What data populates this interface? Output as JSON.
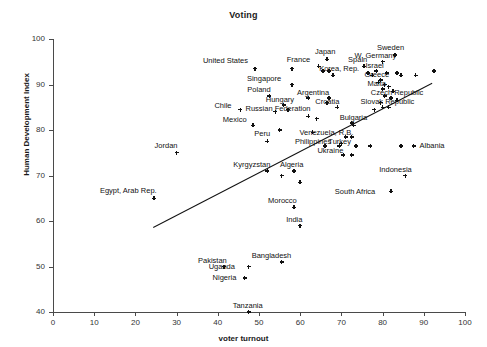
{
  "chart_data": {
    "type": "scatter",
    "title": "Voting",
    "xlabel": "voter turnout",
    "ylabel": "Human Development Index",
    "xlim": [
      0,
      100
    ],
    "ylim": [
      40,
      100
    ],
    "xticks": [
      0,
      10,
      20,
      30,
      40,
      50,
      60,
      70,
      80,
      90,
      100
    ],
    "yticks": [
      40,
      50,
      60,
      70,
      80,
      90,
      100
    ],
    "grid": false,
    "legend": "none",
    "marker_color": "#111111",
    "trendline": {
      "x0": 24.3,
      "y0": 58.7,
      "x1": 92.0,
      "y1": 90.4,
      "color": "#111111"
    },
    "points": [
      {
        "label": "United States",
        "x": 49.0,
        "y": 93.5,
        "lx": -52,
        "ly": -12
      },
      {
        "label": "Singapore",
        "x": 58.0,
        "y": 90.0,
        "lx": -45,
        "ly": -10
      },
      {
        "label": "France",
        "x": 64.5,
        "y": 94.0,
        "lx": -32,
        "ly": -10
      },
      {
        "label": "Japan",
        "x": 66.5,
        "y": 95.5,
        "lx": -12,
        "ly": -11
      },
      {
        "label": "Korea, Rep.",
        "x": 68.0,
        "y": 92.0,
        "lx": -14,
        "ly": -10
      },
      {
        "label": "Spain",
        "x": 75.5,
        "y": 94.0,
        "lx": -16,
        "ly": -10
      },
      {
        "label": "Sweden",
        "x": 83.0,
        "y": 96.5,
        "lx": -18,
        "ly": -11
      },
      {
        "label": "W. Germany",
        "x": 80.0,
        "y": 95.0,
        "lx": -28,
        "ly": -10
      },
      {
        "label": "Israel",
        "x": 78.5,
        "y": 93.0,
        "lx": -11,
        "ly": -9
      },
      {
        "label": "Greece",
        "x": 79.5,
        "y": 91.0,
        "lx": -16,
        "ly": -9
      },
      {
        "label": "Malta",
        "x": 80.0,
        "y": 89.0,
        "lx": -15,
        "ly": -9
      },
      {
        "label": "Czech Republic",
        "x": 82.0,
        "y": 87.0,
        "lx": -20,
        "ly": -9
      },
      {
        "label": "Slovak Republic",
        "x": 80.0,
        "y": 85.0,
        "lx": -22,
        "ly": -9
      },
      {
        "label": "Argentina",
        "x": 67.0,
        "y": 87.0,
        "lx": -32,
        "ly": -9
      },
      {
        "label": "Croatia",
        "x": 69.0,
        "y": 85.0,
        "lx": -22,
        "ly": -9
      },
      {
        "label": "Poland",
        "x": 52.5,
        "y": 87.5,
        "lx": -22,
        "ly": -10
      },
      {
        "label": "Hungary",
        "x": 56.0,
        "y": 85.5,
        "lx": -18,
        "ly": -9
      },
      {
        "label": "Chile",
        "x": 45.5,
        "y": 84.5,
        "lx": -26,
        "ly": -8
      },
      {
        "label": "Russian Federation",
        "x": 54.0,
        "y": 84.0,
        "lx": -30,
        "ly": -7
      },
      {
        "label": "Mexico",
        "x": 48.5,
        "y": 81.0,
        "lx": -30,
        "ly": -9
      },
      {
        "label": "Bulgaria",
        "x": 72.5,
        "y": 81.5,
        "lx": -12,
        "ly": -9
      },
      {
        "label": "Venezuela, R.B.",
        "x": 71.0,
        "y": 78.5,
        "lx": -46,
        "ly": -8
      },
      {
        "label": "Philippines",
        "x": 66.0,
        "y": 76.5,
        "lx": -30,
        "ly": -8
      },
      {
        "label": "Turkey",
        "x": 69.5,
        "y": 76.5,
        "lx": -11,
        "ly": -8
      },
      {
        "label": "Ukraine",
        "x": 70.5,
        "y": 74.5,
        "lx": -26,
        "ly": -8
      },
      {
        "label": "Albania",
        "x": 87.5,
        "y": 76.5,
        "lx": 6,
        "ly": -4
      },
      {
        "label": "Jordan",
        "x": 30.0,
        "y": 75.0,
        "lx": -22,
        "ly": -11
      },
      {
        "label": "Peru",
        "x": 52.0,
        "y": 77.5,
        "lx": -13,
        "ly": -11
      },
      {
        "label": "Kyrgyzstan",
        "x": 52.0,
        "y": 71.0,
        "lx": -34,
        "ly": -10
      },
      {
        "label": "Algeria",
        "x": 58.5,
        "y": 71.0,
        "lx": -14,
        "ly": -10
      },
      {
        "label": "Indonesia",
        "x": 85.5,
        "y": 70.0,
        "lx": -26,
        "ly": -10
      },
      {
        "label": "South Africa",
        "x": 82.0,
        "y": 66.5,
        "lx": -56,
        "ly": -3
      },
      {
        "label": "Egypt, Arab Rep.",
        "x": 24.5,
        "y": 65.0,
        "lx": -54,
        "ly": -11
      },
      {
        "label": "Morocco",
        "x": 58.5,
        "y": 63.0,
        "lx": -26,
        "ly": -10
      },
      {
        "label": "India",
        "x": 60.0,
        "y": 59.0,
        "lx": -14,
        "ly": -10
      },
      {
        "label": "Bangladesh",
        "x": 55.5,
        "y": 51.0,
        "lx": -30,
        "ly": -10
      },
      {
        "label": "Pakistan",
        "x": 41.5,
        "y": 50.0,
        "lx": -26,
        "ly": -10
      },
      {
        "label": "Uganda",
        "x": 47.5,
        "y": 50.0,
        "lx": -40,
        "ly": -4
      },
      {
        "label": "Nigeria",
        "x": 46.5,
        "y": 47.5,
        "lx": -32,
        "ly": -4
      },
      {
        "label": "Tanzania",
        "x": 47.5,
        "y": 40.0,
        "lx": -16,
        "ly": -10
      }
    ],
    "unlabeled_points": [
      {
        "x": 58.0,
        "y": 93.5
      },
      {
        "x": 65.5,
        "y": 93.0
      },
      {
        "x": 67.0,
        "y": 93.0
      },
      {
        "x": 76.5,
        "y": 92.5
      },
      {
        "x": 77.5,
        "y": 92.0
      },
      {
        "x": 81.0,
        "y": 92.5
      },
      {
        "x": 83.5,
        "y": 92.5
      },
      {
        "x": 84.5,
        "y": 92.0
      },
      {
        "x": 88.0,
        "y": 92.0
      },
      {
        "x": 79.0,
        "y": 90.5
      },
      {
        "x": 80.5,
        "y": 90.0
      },
      {
        "x": 81.5,
        "y": 89.5
      },
      {
        "x": 82.5,
        "y": 88.5
      },
      {
        "x": 80.5,
        "y": 87.5
      },
      {
        "x": 83.5,
        "y": 86.5
      },
      {
        "x": 79.5,
        "y": 86.0
      },
      {
        "x": 81.5,
        "y": 85.0
      },
      {
        "x": 78.0,
        "y": 84.5
      },
      {
        "x": 92.5,
        "y": 93.0
      },
      {
        "x": 62.0,
        "y": 87.0
      },
      {
        "x": 66.5,
        "y": 86.0
      },
      {
        "x": 57.0,
        "y": 84.5
      },
      {
        "x": 62.0,
        "y": 83.0
      },
      {
        "x": 64.0,
        "y": 82.5
      },
      {
        "x": 73.0,
        "y": 81.0
      },
      {
        "x": 55.0,
        "y": 80.0
      },
      {
        "x": 63.0,
        "y": 79.5
      },
      {
        "x": 72.5,
        "y": 78.5
      },
      {
        "x": 70.0,
        "y": 77.0
      },
      {
        "x": 73.5,
        "y": 76.5
      },
      {
        "x": 77.0,
        "y": 76.5
      },
      {
        "x": 84.5,
        "y": 76.5
      },
      {
        "x": 72.5,
        "y": 74.5
      },
      {
        "x": 55.5,
        "y": 70.0
      },
      {
        "x": 60.0,
        "y": 68.5
      }
    ]
  }
}
